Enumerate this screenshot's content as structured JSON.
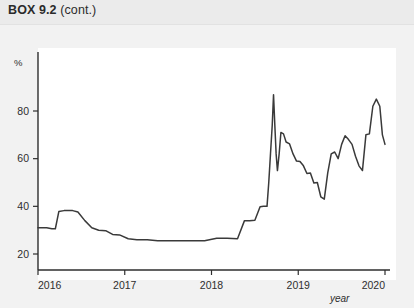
{
  "header": {
    "box_id": "BOX 9.2",
    "box_cont": "(cont.)",
    "ghost_watermark": "                                        "
  },
  "chart_data": {
    "type": "line",
    "title": "",
    "xlabel": "year",
    "ylabel": "%",
    "xlim": [
      2016,
      2020
    ],
    "ylim": [
      0,
      95
    ],
    "grid": false,
    "legend": null,
    "x_ticks": [
      "2016",
      "2017",
      "2018",
      "2019",
      "2020"
    ],
    "x_tick_values": [
      2016,
      2017,
      2018,
      2019,
      2020
    ],
    "y_ticks": [
      "20",
      "40",
      "60",
      "80"
    ],
    "y_tick_values": [
      20,
      40,
      60,
      80
    ],
    "line_color": "#3a3a3a",
    "series": [
      {
        "name": "share",
        "x": [
          2016.0,
          2016.1,
          2016.16,
          2016.2,
          2016.24,
          2016.3,
          2016.4,
          2016.46,
          2016.54,
          2016.62,
          2016.7,
          2016.78,
          2016.86,
          2016.94,
          2017.04,
          2017.14,
          2017.26,
          2017.38,
          2017.5,
          2017.64,
          2017.78,
          2017.92,
          2018.06,
          2018.18,
          2018.3,
          2018.38,
          2018.44,
          2018.5,
          2018.56,
          2018.6,
          2018.64,
          2018.66,
          2018.68,
          2018.7,
          2018.715,
          2018.73,
          2018.745,
          2018.76,
          2018.78,
          2018.8,
          2018.83,
          2018.86,
          2018.9,
          2018.94,
          2018.98,
          2019.02,
          2019.06,
          2019.1,
          2019.14,
          2019.18,
          2019.22,
          2019.26,
          2019.3,
          2019.34,
          2019.38,
          2019.42,
          2019.46,
          2019.5,
          2019.54,
          2019.58,
          2019.62,
          2019.66,
          2019.7,
          2019.74,
          2019.78,
          2019.82,
          2019.86,
          2019.9,
          2019.94,
          2019.97,
          2020.0
        ],
        "y": [
          31.0,
          31.0,
          30.6,
          30.6,
          37.8,
          38.2,
          38.2,
          37.6,
          34.0,
          31.0,
          30.0,
          29.8,
          28.2,
          28.0,
          26.4,
          26.0,
          26.0,
          25.6,
          25.6,
          25.6,
          25.6,
          25.6,
          26.6,
          26.6,
          26.4,
          34.0,
          34.0,
          34.2,
          39.8,
          40.0,
          40.0,
          50.0,
          62.0,
          74.0,
          86.8,
          74.0,
          62.0,
          55.0,
          62.0,
          71.0,
          70.4,
          67.0,
          66.2,
          62.0,
          59.0,
          58.8,
          57.0,
          53.8,
          54.0,
          49.8,
          50.0,
          44.0,
          43.0,
          54.0,
          62.0,
          62.8,
          60.0,
          66.0,
          69.6,
          68.0,
          66.0,
          61.0,
          57.0,
          55.0,
          70.0,
          70.4,
          82.0,
          85.0,
          82.0,
          70.0,
          66.0
        ]
      }
    ]
  },
  "axis": {
    "y_unit": "%",
    "x_name": "year"
  }
}
